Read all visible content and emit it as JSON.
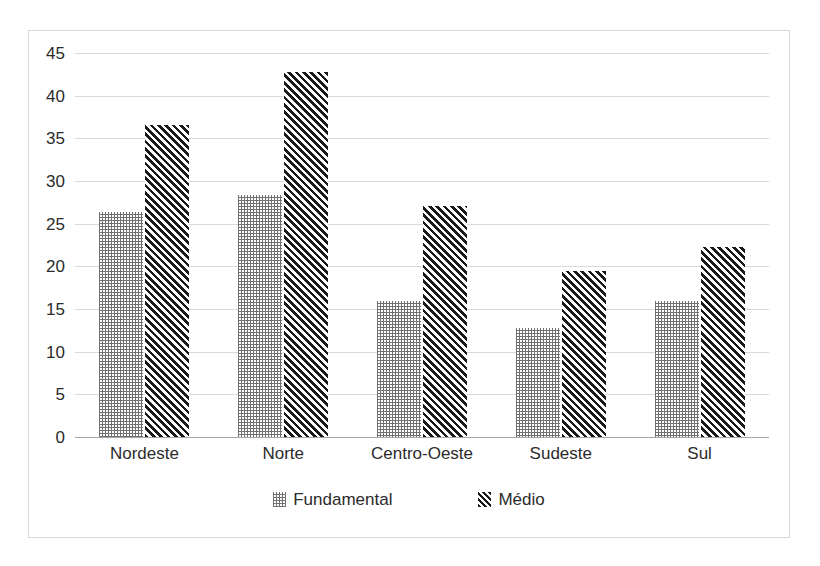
{
  "chart_data": {
    "type": "bar",
    "title": "",
    "subtitle": "",
    "xlabel": "",
    "ylabel": "",
    "categories": [
      "Nordeste",
      "Norte",
      "Centro-Oeste",
      "Sudeste",
      "Sul"
    ],
    "series": [
      {
        "name": "Fundamental",
        "pattern": "dotted",
        "color": "#707070",
        "values": [
          26.4,
          28.4,
          15.9,
          12.8,
          15.9
        ]
      },
      {
        "name": "Médio",
        "pattern": "diagonal-hatch",
        "color": "#1a1a1a",
        "values": [
          36.6,
          42.8,
          27.1,
          19.4,
          22.3
        ]
      }
    ],
    "ylim": [
      0,
      45
    ],
    "ytick_step": 5,
    "yticks": [
      0,
      5,
      10,
      15,
      20,
      25,
      30,
      35,
      40,
      45
    ],
    "ytick_labels": [
      "0",
      "5",
      "10",
      "15",
      "20",
      "25",
      "30",
      "35",
      "40",
      "45"
    ],
    "grid": true,
    "grid_axis": "y",
    "grid_color": "#d9d9d9",
    "baseline_color": "#a6a6a6",
    "legend_position": "bottom",
    "border_color": "#d9d9d9",
    "background": "#ffffff"
  },
  "legend": {
    "entries": [
      {
        "label": "Fundamental"
      },
      {
        "label": "Médio"
      }
    ]
  }
}
